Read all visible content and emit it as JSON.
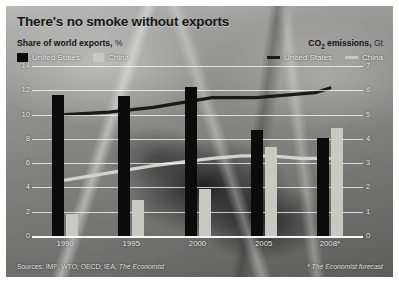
{
  "title": "There's no smoke without exports",
  "left_axis": {
    "caption": "Share of world exports,",
    "unit": "%",
    "legend": [
      {
        "label": "United States",
        "color": "#0b0b0b",
        "marker": "box"
      },
      {
        "label": "China",
        "color": "#c9c9c4",
        "marker": "box"
      }
    ]
  },
  "right_axis": {
    "caption_pre": "CO",
    "caption_sub": "2",
    "caption_post": " emissions,",
    "unit": "Gt",
    "legend": [
      {
        "label": "United States",
        "color": "#1a1a1a",
        "marker": "line"
      },
      {
        "label": "China",
        "color": "#c9c9c4",
        "marker": "line"
      }
    ]
  },
  "footer": {
    "sources": "Sources: IMF; WTO; OECD; IEA;",
    "sources_italic": "The Economist",
    "note": "* The Economist forecast"
  },
  "yticks_left": [
    "14",
    "12",
    "10",
    "8",
    "6",
    "4",
    "2",
    "0"
  ],
  "yticks_right": [
    "7",
    "6",
    "5",
    "4",
    "3",
    "2",
    "1",
    "0"
  ],
  "chart_data": {
    "type": "bar",
    "title": "There's no smoke without exports",
    "xlabel": "",
    "categories": [
      "1990",
      "1995",
      "2000",
      "2005",
      "2008*"
    ],
    "bar_series": [
      {
        "name": "United States",
        "axis": "left",
        "unit": "%",
        "color": "#0b0b0b",
        "values": [
          11.6,
          11.5,
          12.3,
          8.7,
          8.1
        ]
      },
      {
        "name": "China",
        "axis": "left",
        "unit": "%",
        "color": "#c9c9c4",
        "values": [
          1.8,
          3.0,
          3.9,
          7.3,
          8.9
        ]
      }
    ],
    "line_series": [
      {
        "name": "United States",
        "axis": "right",
        "unit": "Gt",
        "color": "#1a1a1a",
        "x": [
          1990,
          1993,
          1996,
          2000,
          2003,
          2005,
          2007,
          2008
        ],
        "values": [
          5.0,
          5.1,
          5.3,
          5.7,
          5.7,
          5.8,
          5.9,
          6.1
        ]
      },
      {
        "name": "China",
        "axis": "right",
        "unit": "Gt",
        "color": "#d2d2ce",
        "x": [
          1990,
          1993,
          1996,
          2000,
          2002,
          2004,
          2006,
          2008
        ],
        "values": [
          2.3,
          2.6,
          2.9,
          3.2,
          3.3,
          3.3,
          3.2,
          3.2
        ]
      }
    ],
    "ylabel": "Share of world exports, %",
    "ylabel_right": "CO2 emissions, Gt",
    "ylim": [
      0,
      14
    ],
    "ylim_right": [
      0,
      7
    ],
    "grid": true,
    "legend_position": "top"
  }
}
